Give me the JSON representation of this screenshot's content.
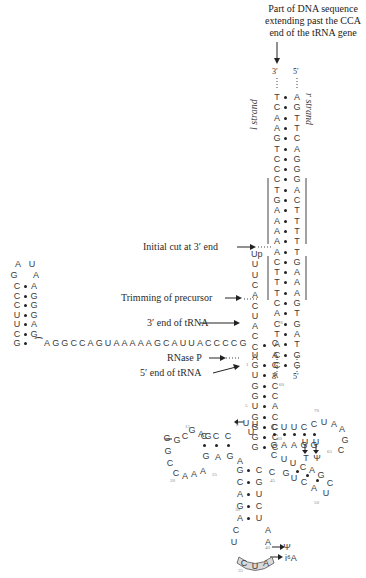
{
  "title_lines": [
    "Part of DNA sequence",
    "extending past the CCA",
    "end of the tRNA gene"
  ],
  "strand_labels": {
    "l": "l strand",
    "r": "r strand",
    "top_l": "3′",
    "top_r": "5′",
    "bot_l": "3′",
    "bot_r": "5′"
  },
  "annotations": {
    "initial_cut": "Initial cut at 3′ end",
    "trimming": "Trimming of precursor",
    "three_end": "3′ end of tRNA",
    "rnase": "RNase P",
    "five_end": "5′ end of tRNA"
  },
  "dna_pairs": [
    [
      "T",
      "A"
    ],
    [
      "C",
      "G"
    ],
    [
      "A",
      "T"
    ],
    [
      "A",
      "T"
    ],
    [
      "G",
      "C"
    ],
    [
      "T",
      "A"
    ],
    [
      "C",
      "G"
    ],
    [
      "C",
      "G"
    ],
    [
      "C",
      "G"
    ],
    [
      "T",
      "A"
    ],
    [
      "G",
      "C"
    ],
    [
      "A",
      "T"
    ],
    [
      "A",
      "T"
    ],
    [
      "A",
      "T"
    ],
    [
      "A",
      "T"
    ],
    [
      "A",
      "T"
    ],
    [
      "C",
      "G"
    ],
    [
      "T",
      "A"
    ],
    [
      "T",
      "A"
    ],
    [
      "T",
      "A"
    ],
    [
      "C",
      "G"
    ],
    [
      "A",
      "T"
    ],
    [
      "C",
      "G"
    ],
    [
      "T",
      "A"
    ],
    [
      "A",
      "T"
    ],
    [
      "C",
      "G"
    ],
    [
      "C",
      "G"
    ]
  ],
  "precursor_3prime": [
    "Up",
    "U",
    "U",
    "C",
    "A",
    "C",
    "U",
    "A",
    "C",
    "C",
    "A"
  ],
  "leader_hairpin": {
    "loop": [
      "A",
      "U",
      "G",
      "A"
    ],
    "pairs": [
      [
        "C",
        "A"
      ],
      [
        "C",
        "G"
      ],
      [
        "C",
        "G"
      ],
      [
        "U",
        "G"
      ],
      [
        "U",
        "A"
      ],
      [
        "C",
        "G"
      ],
      [
        "G",
        "⁀"
      ]
    ],
    "tail": "AGGCCAGUAAAAAGCAUUACCCCG"
  },
  "acceptor_stem": [
    [
      "G",
      "C"
    ],
    [
      "U",
      "A"
    ],
    [
      "G",
      "C"
    ],
    [
      "G",
      "C"
    ],
    [
      "U",
      "A"
    ],
    [
      "G",
      "C"
    ],
    [
      "G",
      "C"
    ],
    [
      "G",
      "C"
    ],
    [
      "G",
      "C"
    ]
  ],
  "labels_numbers": {
    "n1": "1",
    "n5": "5",
    "n8": "8",
    "n10": "10",
    "n15": "15",
    "n20": "20",
    "n25": "25",
    "n30": "30",
    "n35": "35",
    "n40": "40",
    "n45": "45",
    "n50": "50",
    "n55": "55",
    "n60": "60",
    "n65": "65",
    "n70": "70",
    "n76": "76"
  },
  "modifications": {
    "psi": "Ψ",
    "t": "T",
    "i6a": "i⁶A"
  },
  "colors": {
    "ink": "#333333",
    "numbers": "#8a8a8a",
    "anticodon_fill": "#d9d9d9"
  }
}
